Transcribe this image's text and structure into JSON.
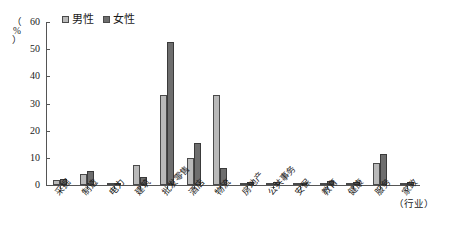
{
  "chart_data": {
    "type": "bar",
    "title": "",
    "xlabel": "（行业）",
    "ylabel": "（%）",
    "ylim": [
      0,
      60
    ],
    "yticks": [
      0,
      10,
      20,
      30,
      40,
      50,
      60
    ],
    "grid": false,
    "legend_position": "top-left",
    "categories": [
      "采掘",
      "制造",
      "电力",
      "建筑",
      "批发零售",
      "酒店",
      "物流",
      "房地产",
      "公共事务",
      "安保",
      "教育",
      "健康",
      "服务",
      "家政"
    ],
    "series": [
      {
        "name": "男性",
        "color": "#b9b9b9",
        "values": [
          2.0,
          4.0,
          0.2,
          7.5,
          33.0,
          9.8,
          33.0,
          0.5,
          0.6,
          0.5,
          0.5,
          0.5,
          8.0,
          0.8
        ]
      },
      {
        "name": "女性",
        "color": "#6e6e6e",
        "values": [
          2.1,
          5.2,
          0.3,
          3.0,
          52.5,
          15.5,
          6.3,
          1.0,
          1.0,
          0.6,
          1.3,
          1.0,
          11.5,
          1.0
        ]
      }
    ]
  },
  "legend": {
    "items": [
      {
        "label": "男性",
        "swatch": "light-gray"
      },
      {
        "label": "女性",
        "swatch": "dark-gray"
      }
    ]
  },
  "axis": {
    "y_unit_top": "（",
    "y_unit_mid": "%",
    "y_unit_bottom": "）",
    "x_title": "（行业）"
  }
}
